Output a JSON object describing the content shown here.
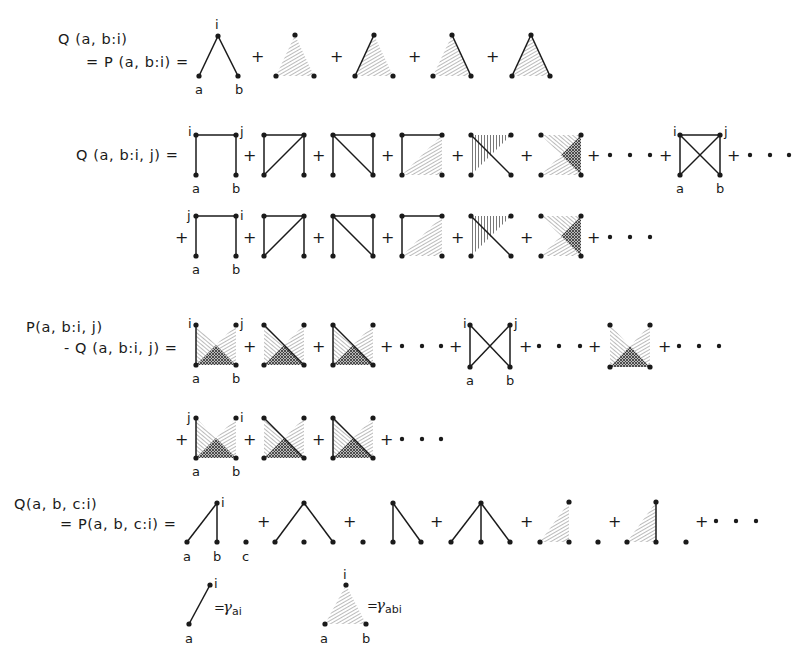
{
  "equations": [
    {
      "id": "Q_ab_i",
      "lhs_line1": "Q (a, b:i)",
      "lhs_line2": "= P (a, b:i)  =",
      "vertex_labels": {
        "top": "i",
        "left": "a",
        "right": "b"
      },
      "terms": [
        "open-path a-i-b",
        "hatched triangle",
        "hatched triangle + edge a-i",
        "hatched triangle + edge i-b",
        "hatched triangle + edges a-i, i-b"
      ],
      "trailing": ""
    },
    {
      "id": "Q_ab_ij",
      "lhs_line1": "Q (a, b:i, j)  =",
      "vertex_labels_row1": {
        "tl": "i",
        "tr": "j",
        "bl": "a",
        "br": "b"
      },
      "vertex_labels_row2": {
        "tl": "j",
        "tr": "i",
        "bl": "a",
        "br": "b"
      },
      "trailing_dots": "+ · · ·"
    },
    {
      "id": "P_minus_Q_ab_ij",
      "lhs_line1": "P(a, b:i, j)",
      "lhs_line2": "- Q (a, b:i, j) =",
      "vertex_labels_row1": {
        "tl": "i",
        "tr": "j",
        "bl": "a",
        "br": "b"
      },
      "vertex_labels_row2": {
        "tl": "j",
        "tr": "i",
        "bl": "a",
        "br": "b"
      }
    },
    {
      "id": "Q_abc_i",
      "lhs_line1": "Q(a, b, c:i)",
      "lhs_line2": "= P(a, b, c:i) =",
      "vertex_labels": {
        "top": "i",
        "a": "a",
        "b": "b",
        "c": "c"
      }
    }
  ],
  "legend": {
    "edge": {
      "top": "i",
      "bottom": "a",
      "eq": "=",
      "symbol": "γ",
      "subscript": "ai"
    },
    "triangle": {
      "top": "i",
      "left": "a",
      "right": "b",
      "eq": "=",
      "symbol": "γ",
      "subscript": "abi"
    }
  },
  "symbols": {
    "plus": "+",
    "ellipsis": "· · ·"
  }
}
